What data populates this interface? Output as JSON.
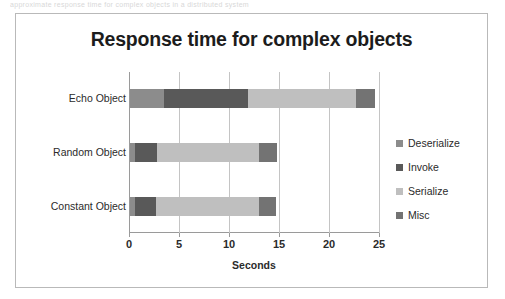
{
  "scan_artifact_text": "approximate response time for complex objects in a distributed system",
  "chart_data": {
    "type": "bar",
    "orientation": "horizontal",
    "stacked": true,
    "title": "Response time for complex objects",
    "xlabel": "Seconds",
    "ylabel": "",
    "xlim": [
      0,
      25
    ],
    "xticks": [
      0,
      5,
      10,
      15,
      20,
      25
    ],
    "xtick_labels": [
      "0",
      "5",
      "10",
      "15",
      "20",
      "25"
    ],
    "grid": "vertical",
    "legend_position": "right",
    "categories": [
      "Echo Object",
      "Random Object",
      "Constant Object"
    ],
    "series": [
      {
        "name": "Deserialize",
        "color": "#8c8c8c",
        "values": [
          3.4,
          0.5,
          0.5
        ]
      },
      {
        "name": "Invoke",
        "color": "#595959",
        "values": [
          8.4,
          2.15,
          2.1
        ]
      },
      {
        "name": "Serialize",
        "color": "#bfbfbf",
        "values": [
          10.8,
          10.25,
          10.3
        ]
      },
      {
        "name": "Misc",
        "color": "#737373",
        "values": [
          1.9,
          1.8,
          1.7
        ]
      }
    ],
    "totals": [
      24.5,
      14.7,
      14.6
    ]
  },
  "colors": {
    "frame_border": "#b9b9b9",
    "gridline": "#c4c4c4",
    "axis": "#9a9a9a",
    "text": "#2b2b2b"
  }
}
